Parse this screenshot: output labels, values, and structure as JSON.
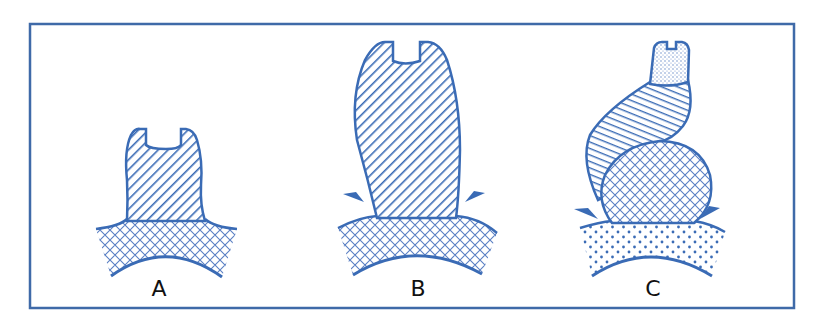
{
  "diagram": {
    "colors": {
      "stroke": "#3a6bb5",
      "frame": "#3f6aa8",
      "background": "#ffffff",
      "label": "#111111"
    },
    "panels": [
      {
        "id": "A",
        "label": "A",
        "description": "Short hatched tube on cross-hatched base with curved underside"
      },
      {
        "id": "B",
        "label": "B",
        "description": "Tall hatched tube on cross-hatched base with two pinching arrows at the junction"
      },
      {
        "id": "C",
        "label": "C",
        "description": "Bent hatched tube with stippled tip, rising from a cross-hatched bulb on a dotted base, with two pinching arrows"
      }
    ],
    "patterns": [
      "diagonal-hatch",
      "horizontal-hatch",
      "cross-hatch",
      "dots",
      "fine-stipple"
    ]
  }
}
